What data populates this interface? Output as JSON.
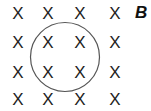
{
  "diagram": {
    "field_symbol": "X",
    "field_label": "B",
    "grid": {
      "rows": 4,
      "cols": 4
    },
    "loop": {
      "shape": "circle",
      "encloses": "central 2x2 field marks"
    },
    "colors": {
      "marks": "#222222",
      "loop": "#555555",
      "background": "#ffffff"
    }
  }
}
